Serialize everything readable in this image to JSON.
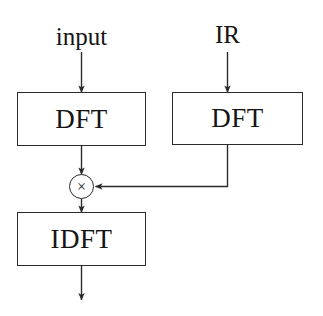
{
  "diagram": {
    "style": {
      "line_color": "#2b2b2b",
      "text_color": "#141414",
      "background": "#ffffff"
    },
    "inputs": [
      {
        "id": "input",
        "label": "input"
      },
      {
        "id": "ir",
        "label": "IR"
      }
    ],
    "nodes": [
      {
        "id": "dft_left",
        "label": "DFT"
      },
      {
        "id": "dft_right",
        "label": "DFT"
      },
      {
        "id": "multiply",
        "label": "×"
      },
      {
        "id": "idft",
        "label": "IDFT"
      }
    ],
    "edges": [
      {
        "from": "input",
        "to": "dft_left"
      },
      {
        "from": "ir",
        "to": "dft_right"
      },
      {
        "from": "dft_left",
        "to": "multiply"
      },
      {
        "from": "dft_right",
        "to": "multiply"
      },
      {
        "from": "multiply",
        "to": "idft"
      },
      {
        "from": "idft",
        "to": "output"
      }
    ]
  }
}
